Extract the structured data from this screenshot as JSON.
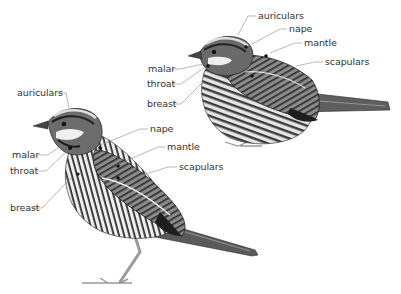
{
  "diagram": {
    "colors": {
      "background": "#ffffff",
      "label_text": "#333333",
      "leader_line": "#888888",
      "plumage_dark": "#2a2a2a",
      "plumage_mid": "#7a7a7a",
      "plumage_light": "#d8d8d8"
    },
    "birds": [
      {
        "id": "left-bird",
        "pose": "standing, facing left",
        "labels": [
          {
            "text": "auriculars",
            "x": 17,
            "y": 90
          },
          {
            "text": "nape",
            "x": 150,
            "y": 125
          },
          {
            "text": "malar",
            "x": 12,
            "y": 151
          },
          {
            "text": "mantle",
            "x": 167,
            "y": 143
          },
          {
            "text": "throat",
            "x": 10,
            "y": 167
          },
          {
            "text": "scapulars",
            "x": 179,
            "y": 163
          },
          {
            "text": "breast",
            "x": 10,
            "y": 204
          }
        ]
      },
      {
        "id": "right-bird",
        "pose": "perched, facing left",
        "labels": [
          {
            "text": "auriculars",
            "x": 258,
            "y": 12
          },
          {
            "text": "nape",
            "x": 289,
            "y": 25
          },
          {
            "text": "mantle",
            "x": 304,
            "y": 39
          },
          {
            "text": "scapulars",
            "x": 325,
            "y": 58
          },
          {
            "text": "malar",
            "x": 148,
            "y": 65
          },
          {
            "text": "throat",
            "x": 147,
            "y": 80
          },
          {
            "text": "breast",
            "x": 147,
            "y": 100
          }
        ]
      }
    ]
  }
}
